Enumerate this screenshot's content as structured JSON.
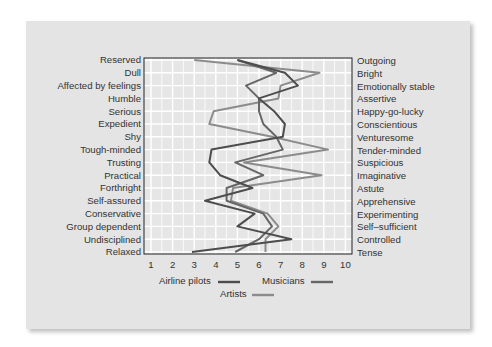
{
  "chart_data": {
    "type": "line",
    "orientation": "horizontal-profile",
    "title": "",
    "xlabel": "",
    "ylabel": "",
    "xlim": [
      1,
      10
    ],
    "x_ticks": [
      "1",
      "2",
      "3",
      "4",
      "5",
      "6",
      "7",
      "8",
      "9",
      "10"
    ],
    "grid": true,
    "legend_position": "bottom",
    "left_labels": [
      "Reserved",
      "Dull",
      "Affected by feelings",
      "Humble",
      "Serious",
      "Expedient",
      "Shy",
      "Tough-minded",
      "Trusting",
      "Practical",
      "Forthright",
      "Self-assured",
      "Conservative",
      "Group dependent",
      "Undisciplined",
      "Relaxed"
    ],
    "right_labels": [
      "Outgoing",
      "Bright",
      "Emotionally stable",
      "Assertive",
      "Happy-go-lucky",
      "Conscientious",
      "Venturesome",
      "Tender-minded",
      "Suspicious",
      "Imaginative",
      "Astute",
      "Apprehensive",
      "Experimenting",
      "Self–sufficient",
      "Controlled",
      "Tense"
    ],
    "series": [
      {
        "name": "Airline pilots",
        "color": "#4d4d4d",
        "values": [
          5.0,
          7.2,
          7.8,
          6.0,
          6.7,
          7.2,
          7.1,
          3.8,
          3.7,
          4.2,
          5.7,
          3.5,
          5.8,
          5.0,
          7.5,
          2.9
        ]
      },
      {
        "name": "Musicians",
        "color": "#666666",
        "values": [
          5.0,
          6.8,
          5.4,
          6.0,
          6.0,
          6.2,
          6.8,
          7.1,
          4.9,
          6.2,
          4.5,
          4.5,
          6.2,
          6.6,
          6.0,
          4.9
        ]
      },
      {
        "name": "Artists",
        "color": "#8c8c8c",
        "values": [
          3.0,
          8.8,
          7.0,
          6.9,
          3.9,
          3.7,
          6.6,
          9.2,
          5.3,
          8.9,
          4.8,
          4.7,
          6.4,
          6.9,
          6.3,
          6.3
        ]
      }
    ]
  },
  "legend": {
    "airline_pilots": "Airline pilots",
    "musicians": "Musicians",
    "artists": "Artists"
  }
}
